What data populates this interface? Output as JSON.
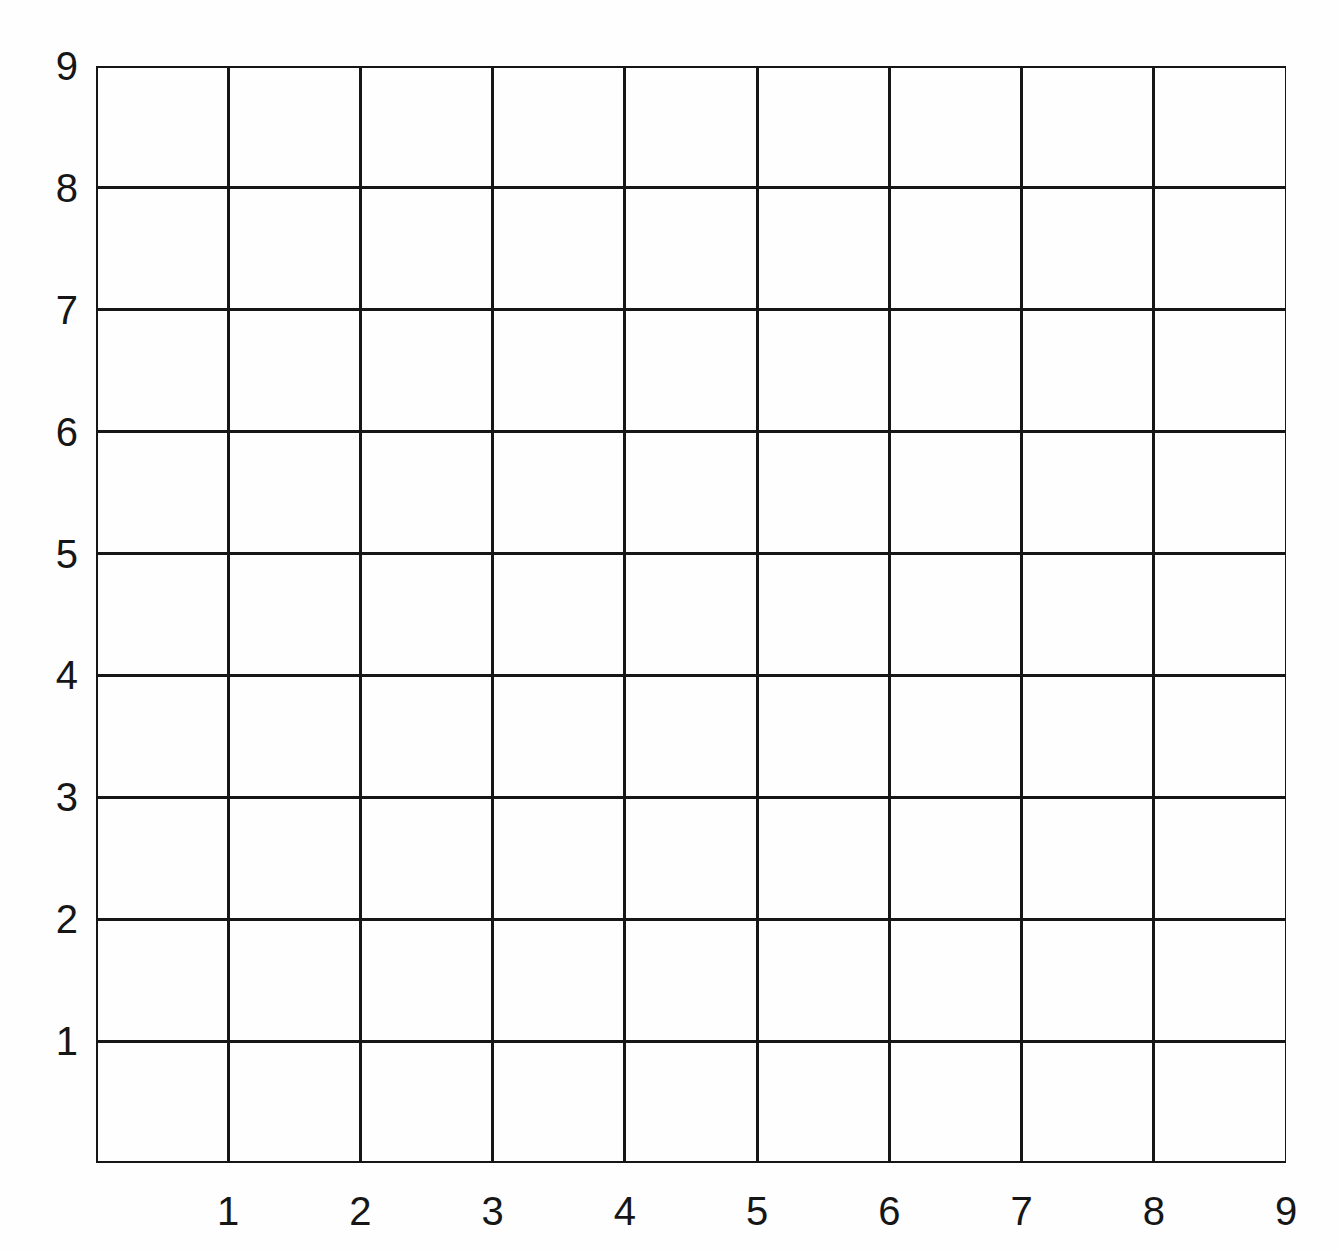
{
  "figure": {
    "background_color": "#fefefe",
    "line_color": "#161616",
    "label_color": "#161616"
  },
  "plot": {
    "left_px": 96,
    "top_px": 66,
    "width_px": 1190,
    "height_px": 1097
  },
  "axes": {
    "x_axis": {
      "name": "x-axis",
      "label": "",
      "tick_labels": [
        "1",
        "2",
        "3",
        "4",
        "5",
        "6",
        "7",
        "8",
        "9"
      ],
      "min": 0,
      "max": 9
    },
    "y_axis": {
      "name": "y-axis",
      "label": "",
      "tick_labels": [
        "1",
        "2",
        "3",
        "4",
        "5",
        "6",
        "7",
        "8",
        "9"
      ],
      "min": 0,
      "max": 9
    }
  },
  "chart_data": {
    "type": "scatter",
    "title": "",
    "subtitle": "",
    "xlabel": "",
    "ylabel": "",
    "xlim": [
      0,
      9
    ],
    "ylim": [
      0,
      9
    ],
    "xticks": [
      1,
      2,
      3,
      4,
      5,
      6,
      7,
      8,
      9
    ],
    "yticks": [
      1,
      2,
      3,
      4,
      5,
      6,
      7,
      8,
      9
    ],
    "xtick_labels": [
      "1",
      "2",
      "3",
      "4",
      "5",
      "6",
      "7",
      "8",
      "9"
    ],
    "ytick_labels": [
      "1",
      "2",
      "3",
      "4",
      "5",
      "6",
      "7",
      "8",
      "9"
    ],
    "grid": true,
    "grid_columns": 9,
    "grid_rows": 9,
    "legend": null,
    "legend_position": "none",
    "annotations": [],
    "series": [],
    "x": [],
    "y": []
  }
}
